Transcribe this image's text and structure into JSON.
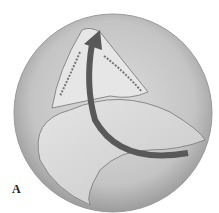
{
  "figure": {
    "panel_label": "A",
    "colors": {
      "background": "#ffffff",
      "circle_fill": "#c9c9c9",
      "circle_edge": "#9a9a9a",
      "flap_fill": "#d2d2d2",
      "arrow": "#5a5a5a",
      "opening": "#e2e2e2"
    }
  }
}
